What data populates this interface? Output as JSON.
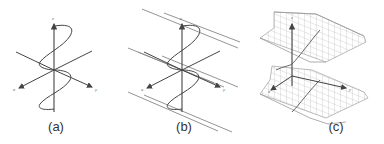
{
  "figure": {
    "panels": [
      {
        "id": "a",
        "caption": "(a)",
        "axes": {
          "x": "x",
          "y": "y",
          "z": "z"
        },
        "content": "helix with axes"
      },
      {
        "id": "b",
        "caption": "(b)",
        "axes": {
          "x": "x",
          "y": "y",
          "z": "z"
        },
        "content": "helix with axes and parallel lines"
      },
      {
        "id": "c",
        "caption": "(c)",
        "axes": {
          "x": "x",
          "y": "y",
          "z": "z"
        },
        "content": "helicoidal wireframe surface with axes"
      }
    ]
  },
  "colors": {
    "line": "#444444",
    "parallel": "#888888",
    "mesh": "#aaaaaa",
    "caption": "#333333"
  }
}
